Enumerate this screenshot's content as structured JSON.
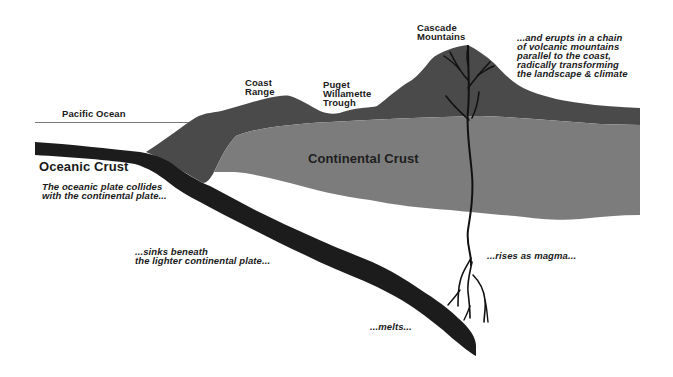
{
  "colors": {
    "background": "#ffffff",
    "oceanic_crust": "#1c1c1c",
    "upper_crust_mountains": "#4a4a4a",
    "continental_crust": "#7c7c7c",
    "magma": "#111111",
    "text": "#1a1a1a",
    "sea_level_line": "#777777"
  },
  "labels": {
    "pacific_ocean": "Pacific Ocean",
    "coast_range": "Coast\nRange",
    "puget_trough": "Puget\nWillamette\nTrough",
    "cascade_mountains": "Cascade\nMountains",
    "continental_crust": "Continental Crust",
    "oceanic_crust": "Oceanic Crust"
  },
  "annotations": {
    "collides": "The oceanic plate collides\nwith the continental plate...",
    "sinks": "...sinks beneath\nthe lighter continental plate...",
    "melts": "...melts...",
    "rises": "...rises as magma...",
    "erupts": "...and erupts in a chain\nof volcanic mountains\nparallel to the coast,\nradically transforming\nthe landscape & climate"
  }
}
